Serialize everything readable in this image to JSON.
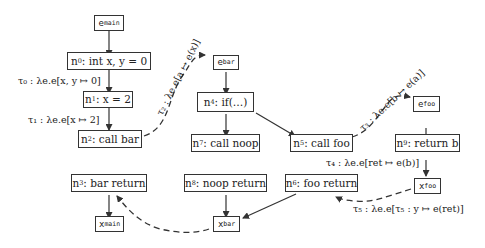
{
  "nodes": {
    "e_main": {
      "base": "e",
      "sub": "main"
    },
    "n0": {
      "id": "n",
      "idsub": "0",
      "text": " : int x, y = 0"
    },
    "n1": {
      "id": "n",
      "idsub": "1",
      "text": " : x = 2"
    },
    "n2": {
      "id": "n",
      "idsub": "2",
      "text": " : call bar"
    },
    "n3": {
      "id": "n",
      "idsub": "3",
      "text": " : bar return"
    },
    "x_main": {
      "base": "x",
      "sub": "main"
    },
    "e_bar": {
      "base": "e",
      "sub": "bar"
    },
    "n4": {
      "id": "n",
      "idsub": "4",
      "text": " : if(…)"
    },
    "n7": {
      "id": "n",
      "idsub": "7",
      "text": " : call noop"
    },
    "n8": {
      "id": "n",
      "idsub": "8",
      "text": " : noop return"
    },
    "x_bar": {
      "base": "x",
      "sub": "bar"
    },
    "n5": {
      "id": "n",
      "idsub": "5",
      "text": " : call foo"
    },
    "n6": {
      "id": "n",
      "idsub": "6",
      "text": " : foo return"
    },
    "e_foo": {
      "base": "e",
      "sub": "foo"
    },
    "n9": {
      "id": "n",
      "idsub": "9",
      "text": " : return b"
    },
    "x_foo": {
      "base": "x",
      "sub": "foo"
    }
  },
  "labels": {
    "tau0": "τ₀ : λe.e[x, y ↦ 0]",
    "tau1": "τ₁ : λe.e[x ↦ 2]",
    "tau2": "τ₂ : λe.e[a ↦ e(x)]",
    "tau3": "τ₃ : λe.e[b ↦ e(a)]",
    "tau4": "τ₄ : λe.e[ret ↦ e(b)]",
    "tau5": "τ₅ : λe.e[τ₅ : y ↦ e(ret)]"
  }
}
